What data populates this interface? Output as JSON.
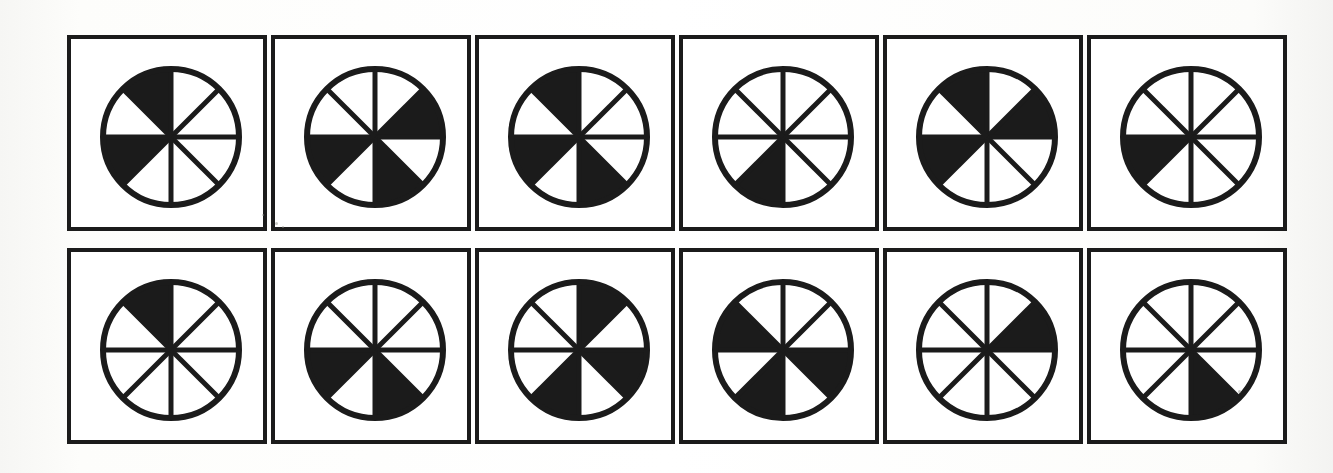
{
  "figure": {
    "type": "diagram",
    "rows": 2,
    "columns": 6,
    "sectors_per_circle": 8,
    "sector_angle_degrees": 45,
    "colors": {
      "ink": "#1b1b1b",
      "fill": "#1b1b1b",
      "empty": "#ffffff",
      "page": "#fdfdfb",
      "panel": "#ffffff"
    },
    "sector_labels": [
      "12:00-1:30",
      "1:30-3:00",
      "3:00-4:30",
      "4:30-6:00",
      "6:00-7:30",
      "7:30-9:00",
      "9:00-10:30",
      "10:30-12:00"
    ]
  },
  "panels": [
    {
      "index": 1,
      "row": 1,
      "column": 1,
      "name": "panel-1",
      "filled_sectors": [
        5,
        7
      ],
      "filled_count": 2,
      "fraction": "2/8",
      "x": 67,
      "y": 35,
      "width": 200,
      "height": 196,
      "circle_cx": 100,
      "circle_cy": 98,
      "circle_r": 68
    },
    {
      "index": 2,
      "row": 1,
      "column": 2,
      "name": "panel-2",
      "filled_sectors": [
        1,
        3,
        5
      ],
      "filled_count": 3,
      "fraction": "3/8",
      "x": 271,
      "y": 35,
      "width": 200,
      "height": 196,
      "circle_cx": 100,
      "circle_cy": 98,
      "circle_r": 68
    },
    {
      "index": 3,
      "row": 1,
      "column": 3,
      "name": "panel-3",
      "filled_sectors": [
        3,
        5,
        7
      ],
      "filled_count": 3,
      "fraction": "3/8",
      "x": 475,
      "y": 35,
      "width": 200,
      "height": 196,
      "circle_cx": 100,
      "circle_cy": 98,
      "circle_r": 68
    },
    {
      "index": 4,
      "row": 1,
      "column": 4,
      "name": "panel-4",
      "filled_sectors": [
        4
      ],
      "filled_count": 1,
      "fraction": "1/8",
      "x": 679,
      "y": 35,
      "width": 200,
      "height": 196,
      "circle_cx": 100,
      "circle_cy": 98,
      "circle_r": 68
    },
    {
      "index": 5,
      "row": 1,
      "column": 5,
      "name": "panel-5",
      "filled_sectors": [
        1,
        5,
        7
      ],
      "filled_count": 3,
      "fraction": "3/8",
      "x": 883,
      "y": 35,
      "width": 200,
      "height": 196,
      "circle_cx": 100,
      "circle_cy": 98,
      "circle_r": 68
    },
    {
      "index": 6,
      "row": 1,
      "column": 6,
      "name": "panel-6",
      "filled_sectors": [
        5
      ],
      "filled_count": 1,
      "fraction": "1/8",
      "x": 1087,
      "y": 35,
      "width": 200,
      "height": 196,
      "circle_cx": 100,
      "circle_cy": 98,
      "circle_r": 68
    },
    {
      "index": 7,
      "row": 2,
      "column": 1,
      "name": "panel-7",
      "filled_sectors": [
        7
      ],
      "filled_count": 1,
      "fraction": "1/8",
      "x": 67,
      "y": 248,
      "width": 200,
      "height": 196,
      "circle_cx": 100,
      "circle_cy": 98,
      "circle_r": 68
    },
    {
      "index": 8,
      "row": 2,
      "column": 2,
      "name": "panel-8",
      "filled_sectors": [
        3,
        5
      ],
      "filled_count": 2,
      "fraction": "2/8",
      "x": 271,
      "y": 248,
      "width": 200,
      "height": 196,
      "circle_cx": 100,
      "circle_cy": 98,
      "circle_r": 68
    },
    {
      "index": 9,
      "row": 2,
      "column": 3,
      "name": "panel-9",
      "filled_sectors": [
        0,
        2,
        4
      ],
      "filled_count": 3,
      "fraction": "3/8",
      "x": 475,
      "y": 248,
      "width": 200,
      "height": 196,
      "circle_cx": 100,
      "circle_cy": 98,
      "circle_r": 68
    },
    {
      "index": 10,
      "row": 2,
      "column": 4,
      "name": "panel-10",
      "filled_sectors": [
        2,
        4,
        6
      ],
      "filled_count": 3,
      "fraction": "3/8",
      "x": 679,
      "y": 248,
      "width": 200,
      "height": 196,
      "circle_cx": 100,
      "circle_cy": 98,
      "circle_r": 68
    },
    {
      "index": 11,
      "row": 2,
      "column": 5,
      "name": "panel-11",
      "filled_sectors": [
        1
      ],
      "filled_count": 1,
      "fraction": "1/8",
      "x": 883,
      "y": 248,
      "width": 200,
      "height": 196,
      "circle_cx": 100,
      "circle_cy": 98,
      "circle_r": 68
    },
    {
      "index": 12,
      "row": 2,
      "column": 6,
      "name": "panel-12",
      "filled_sectors": [
        3
      ],
      "filled_count": 1,
      "fraction": "1/8",
      "x": 1087,
      "y": 248,
      "width": 200,
      "height": 196,
      "circle_cx": 100,
      "circle_cy": 98,
      "circle_r": 68
    }
  ],
  "specks": [
    {
      "x": 275,
      "y": 222,
      "size": 3
    },
    {
      "x": 282,
      "y": 226,
      "size": 2
    },
    {
      "x": 262,
      "y": 214,
      "size": 2
    },
    {
      "x": 1238,
      "y": 390,
      "size": 3
    }
  ]
}
